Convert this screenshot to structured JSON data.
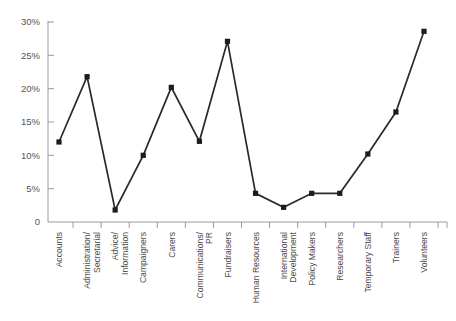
{
  "chart_data": {
    "type": "line",
    "title": "",
    "xlabel": "",
    "ylabel": "",
    "ylim": [
      0,
      30
    ],
    "yticks": [
      0,
      5,
      10,
      15,
      20,
      25,
      30
    ],
    "ytick_labels": [
      "0",
      "5%",
      "10%",
      "15%",
      "20%",
      "25%",
      "30%"
    ],
    "grid": false,
    "legend": "none",
    "marker": "square",
    "line_color": "#2a2a2a",
    "marker_color": "#1c1c1c",
    "axis_color": "#9a9a9a",
    "categories": [
      "Accounts",
      "Administration/ Secretarial",
      "Advice/ Information",
      "Campaigners",
      "Carers",
      "Communications/ PR",
      "Fundraisers",
      "Human Resources",
      "International Development",
      "Policy Makers",
      "Researchers",
      "Temporary Staff",
      "Trainers",
      "Volunteers"
    ],
    "category_lines": [
      [
        "Accounts"
      ],
      [
        "Administration/",
        "Secretarial"
      ],
      [
        "Advice/",
        "Information"
      ],
      [
        "Campaigners"
      ],
      [
        "Carers"
      ],
      [
        "Communications/",
        "PR"
      ],
      [
        "Fundraisers"
      ],
      [
        "Human Resources"
      ],
      [
        "International",
        "Development"
      ],
      [
        "Policy Makers"
      ],
      [
        "Researchers"
      ],
      [
        "Temporary Staff"
      ],
      [
        "Trainers"
      ],
      [
        "Volunteers"
      ]
    ],
    "values": [
      12.0,
      21.8,
      1.8,
      10.0,
      20.2,
      12.1,
      27.1,
      4.3,
      2.2,
      4.3,
      4.3,
      10.2,
      16.5,
      28.6
    ]
  }
}
